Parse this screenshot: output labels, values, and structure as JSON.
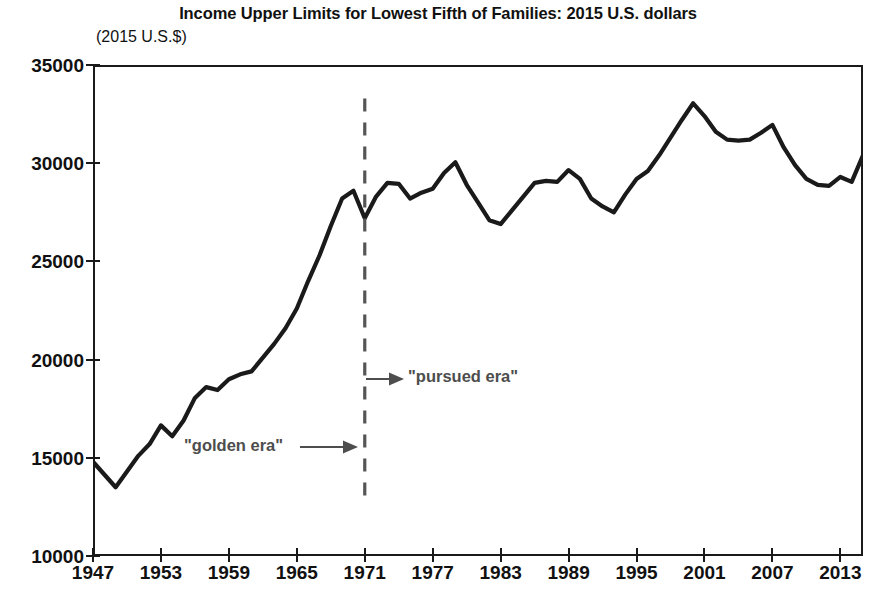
{
  "chart_data": {
    "type": "line",
    "title": "Income Upper Limits for Lowest Fifth of Families: 2015 U.S. dollars",
    "subtitle": "(2015 U.S.$)",
    "xlabel": "",
    "ylabel": "",
    "ylim": [
      10000,
      35000
    ],
    "xlim": [
      1947,
      2015
    ],
    "ytick_labels": [
      "35000",
      "30000",
      "25000",
      "20000",
      "15000",
      "10000"
    ],
    "ytick_values": [
      35000,
      30000,
      25000,
      20000,
      15000,
      10000
    ],
    "xtick_labels": [
      "1947",
      "1953",
      "1959",
      "1965",
      "1971",
      "1977",
      "1983",
      "1989",
      "1995",
      "2001",
      "2007",
      "2013"
    ],
    "xtick_values": [
      1947,
      1953,
      1959,
      1965,
      1971,
      1977,
      1983,
      1989,
      1995,
      2001,
      2007,
      2013
    ],
    "grid": false,
    "legend": "none",
    "line_color": "#1a1a1a",
    "series": [
      {
        "name": "Income upper limit, lowest fifth of families",
        "x": [
          1947,
          1948,
          1949,
          1950,
          1951,
          1952,
          1953,
          1954,
          1955,
          1956,
          1957,
          1958,
          1959,
          1960,
          1961,
          1962,
          1963,
          1964,
          1965,
          1966,
          1967,
          1968,
          1969,
          1970,
          1971,
          1972,
          1973,
          1974,
          1975,
          1976,
          1977,
          1978,
          1979,
          1980,
          1981,
          1982,
          1983,
          1984,
          1985,
          1986,
          1987,
          1988,
          1989,
          1990,
          1991,
          1992,
          1993,
          1994,
          1995,
          1996,
          1997,
          1998,
          1999,
          2000,
          2001,
          2002,
          2003,
          2004,
          2005,
          2006,
          2007,
          2008,
          2009,
          2010,
          2011,
          2012,
          2013,
          2014,
          2015
        ],
        "values": [
          14800,
          14150,
          13500,
          14300,
          15100,
          15700,
          16650,
          16100,
          16900,
          18050,
          18600,
          18450,
          19000,
          19250,
          19400,
          20100,
          20800,
          21600,
          22600,
          24000,
          25300,
          26800,
          28200,
          28600,
          27200,
          28300,
          29000,
          28950,
          28200,
          28500,
          28700,
          29500,
          30050,
          28900,
          28000,
          27100,
          26900,
          27600,
          28300,
          29000,
          29100,
          29050,
          29650,
          29200,
          28200,
          27800,
          27500,
          28400,
          29200,
          29600,
          30400,
          31300,
          32200,
          33050,
          32400,
          31600,
          31200,
          31150,
          31200,
          31550,
          31950,
          30800,
          29900,
          29200,
          28900,
          28850,
          29300,
          29050,
          30400
        ]
      }
    ],
    "annotations": [
      {
        "name": "golden-era",
        "text": "\"golden era\"",
        "arrow": "right",
        "points_to_year": 1971
      },
      {
        "name": "pursued-era",
        "text": "\"pursued era\"",
        "arrow": "right",
        "points_from_year": 1971
      }
    ],
    "reference_lines": [
      {
        "name": "era-divider",
        "orientation": "vertical",
        "value": 1971,
        "style": "dashed",
        "color": "#555555"
      }
    ]
  }
}
